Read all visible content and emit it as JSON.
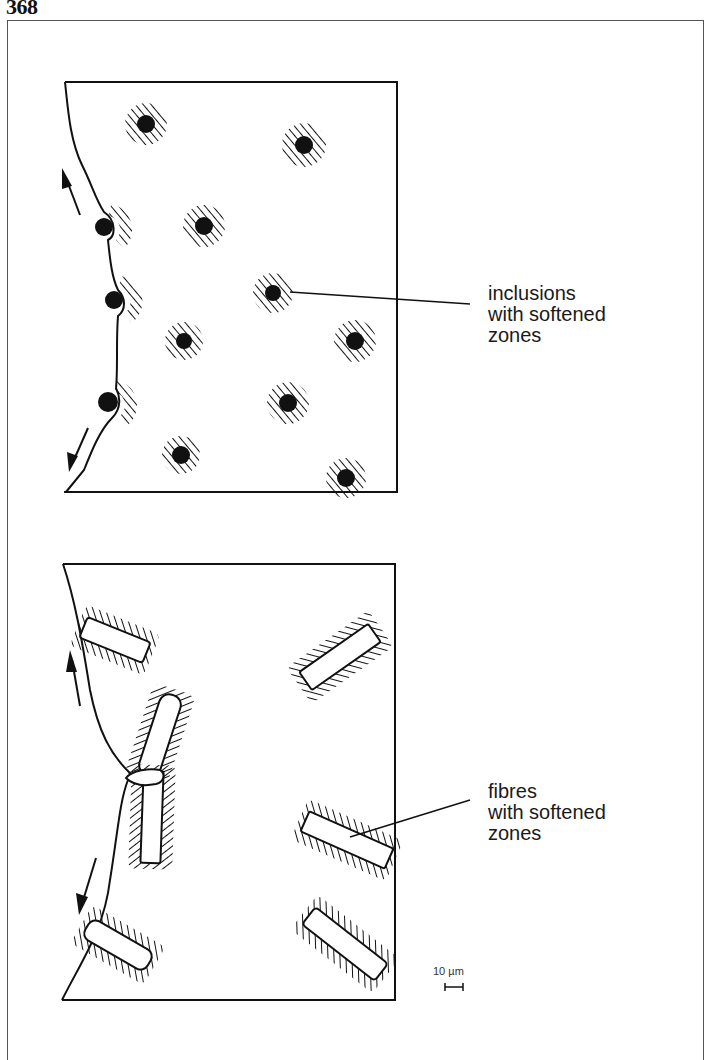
{
  "page": {
    "number": "368"
  },
  "figure": {
    "top_panel": {
      "label_lines": [
        "inclusions",
        "with softened",
        "zones"
      ],
      "feature": "inclusions",
      "inclusion_count_interior": 9,
      "inclusion_count_on_crack": 3
    },
    "bottom_panel": {
      "label_lines": [
        "fibres",
        "with softened",
        "zones"
      ],
      "feature": "fibres",
      "fibre_count": 7
    },
    "scale_bar": {
      "label": "10 µm"
    },
    "colors": {
      "ink": "#111111",
      "background": "#ffffff",
      "frame": "#555555"
    }
  }
}
